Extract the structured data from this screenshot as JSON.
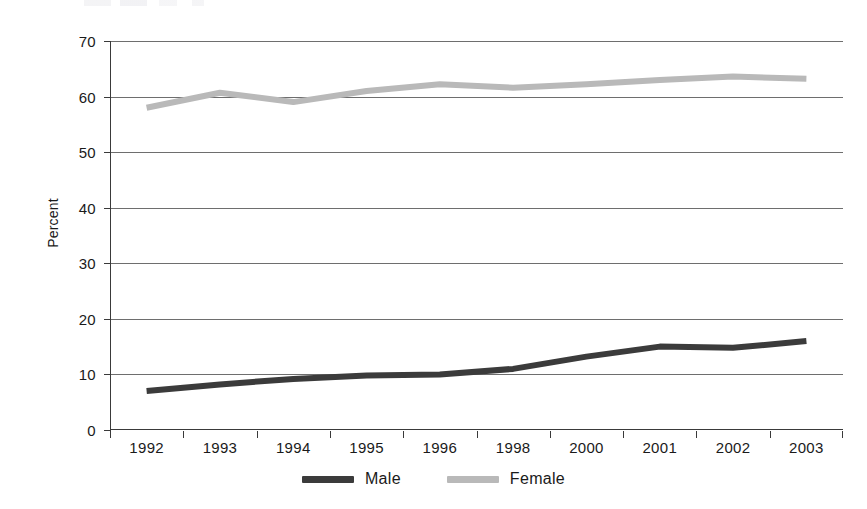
{
  "chart_data": {
    "type": "line",
    "title": "",
    "xlabel": "",
    "ylabel": "Percent",
    "ylim": [
      0,
      70
    ],
    "ytick_step": 10,
    "grid": true,
    "legend_position": "bottom",
    "categories": [
      "1992",
      "1993",
      "1994",
      "1995",
      "1996",
      "1998",
      "2000",
      "2001",
      "2002",
      "2003"
    ],
    "ytick_labels": [
      "70",
      "60",
      "50",
      "40",
      "30",
      "20",
      "10",
      "0"
    ],
    "series": [
      {
        "name": "Male",
        "color": "#3b3b3b",
        "values": [
          7.0,
          8.2,
          9.2,
          9.8,
          10.0,
          11.0,
          13.2,
          15.0,
          14.8,
          16.0
        ]
      },
      {
        "name": "Female",
        "color": "#b9b9b9",
        "values": [
          58.0,
          60.7,
          59.0,
          61.0,
          62.2,
          61.6,
          62.2,
          63.0,
          63.6,
          63.2
        ]
      }
    ]
  },
  "axis": {
    "y_label": "Percent",
    "y_ticks": [
      "70",
      "60",
      "50",
      "40",
      "30",
      "20",
      "10",
      "0"
    ],
    "x_ticks": [
      "1992",
      "1993",
      "1994",
      "1995",
      "1996",
      "1998",
      "2000",
      "2001",
      "2002",
      "2003"
    ]
  },
  "legend": {
    "items": [
      {
        "label": "Male",
        "color": "#3b3b3b"
      },
      {
        "label": "Female",
        "color": "#b9b9b9"
      }
    ]
  }
}
